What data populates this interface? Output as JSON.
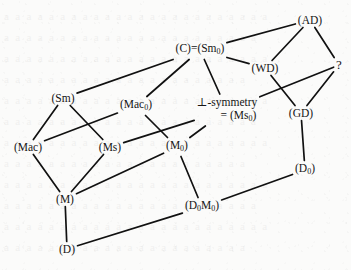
{
  "figure": {
    "type": "hasse-diagram",
    "background_color": "#fbfbfa",
    "line_color": "#111111",
    "text_color": "#151515",
    "bleed_through_text": "a a a a a a a a a a a a a a a a a a a a a a a a\na a a a a a a a a a a a a a a a a a a a a a a\na a a a a a a a a a a a a a a a a a a a a a a a\na a a a a a a a a a a a a a a a a a a a a a\na a a a a a a a a a a a a a a a a a a a a a a a\na a a a a a a a a a a a a a a a a a a a a a a\na a a a a a a a a a a a a a a a a a a a a a a a\na a a a a a a a a a a a a a a a a a a a a a\na a a a a a a a a a a a a a a a a a a a a a a a\na a a a a a a a a a a a a a a a a a a a a a a\na a a a a a a a a a a a a a a a a a a a a a a a\na a a a a a a a a a a a a a a a a a a a a a"
  },
  "nodes": [
    {
      "id": "AD",
      "label_html": "(AD)",
      "text": "(AD)",
      "x": 310,
      "y": 20,
      "lines": 1
    },
    {
      "id": "C",
      "label_html": "(C)=(Sm<sub>0</sub>)",
      "text": "(C)=(Sm0)",
      "x": 200,
      "y": 50,
      "lines": 1
    },
    {
      "id": "WD",
      "label_html": "(WD)",
      "text": "(WD)",
      "x": 265,
      "y": 68,
      "lines": 1
    },
    {
      "id": "QM",
      "label_html": "?",
      "text": "?",
      "x": 339,
      "y": 65,
      "lines": 1
    },
    {
      "id": "Sm",
      "label_html": "(Sm)",
      "text": "(Sm)",
      "x": 63,
      "y": 98,
      "lines": 1
    },
    {
      "id": "Mac0",
      "label_html": "(Mac<sub>0</sub>)",
      "text": "(Mac0)",
      "x": 136,
      "y": 106,
      "lines": 1
    },
    {
      "id": "Ms0",
      "label_html": "&perp;-symmetry",
      "text": "⊥-symmetry = (Ms0)",
      "x": 227,
      "y": 110,
      "lines": 2,
      "line2_html": "= (Ms<sub>0</sub>)",
      "line2_text": "= (Ms0)"
    },
    {
      "id": "GD",
      "label_html": "(GD)",
      "text": "(GD)",
      "x": 301,
      "y": 113,
      "lines": 1
    },
    {
      "id": "Mac",
      "label_html": "(Mac)",
      "text": "(Mac)",
      "x": 28,
      "y": 147,
      "lines": 1
    },
    {
      "id": "Ms",
      "label_html": "(Ms)",
      "text": "(Ms)",
      "x": 110,
      "y": 147,
      "lines": 1
    },
    {
      "id": "M0",
      "label_html": "(M<sub>0</sub>)",
      "text": "(M0)",
      "x": 177,
      "y": 147,
      "lines": 1
    },
    {
      "id": "D0",
      "label_html": "(D<sub>0</sub>)",
      "text": "(D0)",
      "x": 305,
      "y": 170,
      "lines": 1
    },
    {
      "id": "M",
      "label_html": "(M)",
      "text": "(M)",
      "x": 65,
      "y": 199,
      "lines": 1
    },
    {
      "id": "D0M0",
      "label_html": "(D<sub>0</sub>M<sub>0</sub>)",
      "text": "(D0M0)",
      "x": 202,
      "y": 207,
      "lines": 1
    },
    {
      "id": "D",
      "label_html": "(D)",
      "text": "(D)",
      "x": 67,
      "y": 249,
      "lines": 1
    }
  ],
  "edges": [
    {
      "from": "AD",
      "to": "C"
    },
    {
      "from": "AD",
      "to": "WD"
    },
    {
      "from": "AD",
      "to": "QM"
    },
    {
      "from": "C",
      "to": "Sm"
    },
    {
      "from": "C",
      "to": "Mac0"
    },
    {
      "from": "C",
      "to": "Ms0"
    },
    {
      "from": "C",
      "to": "WD"
    },
    {
      "from": "WD",
      "to": "GD"
    },
    {
      "from": "QM",
      "to": "Ms0"
    },
    {
      "from": "QM",
      "to": "GD"
    },
    {
      "from": "Sm",
      "to": "Mac"
    },
    {
      "from": "Sm",
      "to": "Ms"
    },
    {
      "from": "Mac0",
      "to": "Mac"
    },
    {
      "from": "Mac0",
      "to": "M0"
    },
    {
      "from": "Ms0",
      "to": "Ms"
    },
    {
      "from": "Ms0",
      "to": "M0"
    },
    {
      "from": "GD",
      "to": "D0"
    },
    {
      "from": "Mac",
      "to": "M"
    },
    {
      "from": "Ms",
      "to": "M"
    },
    {
      "from": "M0",
      "to": "M"
    },
    {
      "from": "M0",
      "to": "D0M0"
    },
    {
      "from": "D0",
      "to": "D0M0"
    },
    {
      "from": "M",
      "to": "D"
    },
    {
      "from": "D",
      "to": "D0M0"
    }
  ]
}
